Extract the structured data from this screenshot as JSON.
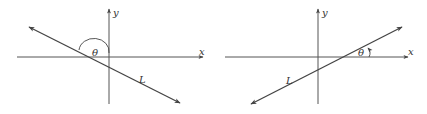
{
  "diagrams": [
    {
      "id": "left",
      "x_label": "x",
      "y_label": "y",
      "angle_label": "θ",
      "line_label": "L",
      "slope": "negative",
      "angle_type": "obtuse"
    },
    {
      "id": "right",
      "x_label": "x",
      "y_label": "y",
      "angle_label": "θ",
      "line_label": "L",
      "slope": "positive",
      "angle_type": "acute"
    }
  ],
  "colors": {
    "axis": "#555555",
    "line": "#444444",
    "text": "#333333"
  }
}
